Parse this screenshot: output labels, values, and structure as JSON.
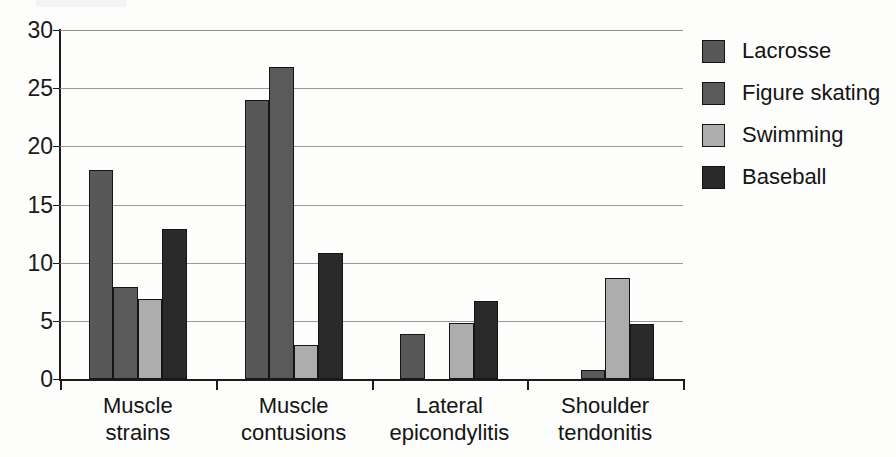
{
  "chart_data": {
    "type": "bar",
    "title": "",
    "subtitle": "",
    "xlabel": "",
    "ylabel": "",
    "ylim": [
      0,
      30
    ],
    "yticks": [
      0,
      5,
      10,
      15,
      20,
      25,
      30
    ],
    "ytick_labels": [
      "0",
      "5",
      "10",
      "15",
      "20",
      "25",
      "30"
    ],
    "grid": true,
    "grid_axis": "y",
    "legend_position": "right",
    "orientation": "vertical",
    "grouping": "grouped",
    "categories": [
      "Muscle strains",
      "Muscle contusions",
      "Lateral epicondylitis",
      "Shoulder tendonitis"
    ],
    "category_lines": [
      [
        "Muscle",
        "strains"
      ],
      [
        "Muscle",
        "contusions"
      ],
      [
        "Lateral",
        "epicondylitis"
      ],
      [
        "Shoulder",
        "tendonitis"
      ]
    ],
    "series": [
      {
        "name": "Lacrosse",
        "color": "#585858",
        "values": [
          18.0,
          24.0,
          3.9,
          0.0
        ]
      },
      {
        "name": "Figure skating",
        "color": "#5a5a5a",
        "values": [
          7.9,
          26.8,
          0.0,
          0.8
        ]
      },
      {
        "name": "Swimming",
        "color": "#adadad",
        "values": [
          6.9,
          2.9,
          4.8,
          8.7
        ]
      },
      {
        "name": "Baseball",
        "color": "#2a2a2a",
        "values": [
          12.9,
          10.8,
          6.7,
          4.7
        ]
      }
    ]
  },
  "legend": {
    "entries": [
      {
        "label": "Lacrosse",
        "color": "#585858"
      },
      {
        "label": "Figure skating",
        "color": "#5a5a5a"
      },
      {
        "label": "Swimming",
        "color": "#adadad"
      },
      {
        "label": "Baseball",
        "color": "#2a2a2a"
      }
    ]
  },
  "colors": {
    "axis": "#1c1c1c",
    "gridline": "#9a9a9a",
    "text": "#141414",
    "background": "#fdfdfc"
  }
}
